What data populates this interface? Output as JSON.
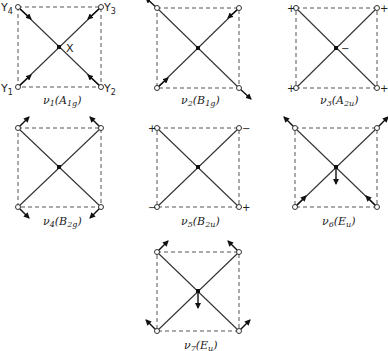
{
  "atom_labels": {
    "center": "X",
    "y1": "Y1",
    "y2": "Y2",
    "y3": "Y3",
    "y4": "Y4"
  },
  "modes": [
    {
      "id": "v1",
      "nu": "ν",
      "index": "1",
      "symmetry": "A",
      "sym_sub": "1g",
      "label": "ν1(A1g)",
      "type": "in-plane stretch, all outward"
    },
    {
      "id": "v2",
      "nu": "ν",
      "index": "2",
      "symmetry": "B",
      "sym_sub": "1g",
      "label": "ν2(B1g)",
      "type": "in-plane stretch, alternating"
    },
    {
      "id": "v3",
      "nu": "ν",
      "index": "3",
      "symmetry": "A",
      "sym_sub": "2u",
      "label": "ν3(A2u)",
      "type": "out-of-plane",
      "signs": {
        "corners": "+",
        "center": "−"
      }
    },
    {
      "id": "v4",
      "nu": "ν",
      "index": "4",
      "symmetry": "B",
      "sym_sub": "2g",
      "label": "ν4(B2g)",
      "type": "in-plane bend"
    },
    {
      "id": "v5",
      "nu": "ν",
      "index": "5",
      "symmetry": "B",
      "sym_sub": "2u",
      "label": "ν5(B2u)",
      "type": "out-of-plane",
      "signs": {
        "top_left": "+",
        "top_right": "−",
        "bottom_left": "−",
        "bottom_right": "+"
      }
    },
    {
      "id": "v6",
      "nu": "ν",
      "index": "6",
      "symmetry": "E",
      "sym_sub": "u",
      "label": "ν6(Eu)",
      "type": "asymmetric stretch"
    },
    {
      "id": "v7",
      "nu": "ν",
      "index": "7",
      "symmetry": "E",
      "sym_sub": "u",
      "label": "ν7(Eu)",
      "type": "asymmetric bend"
    }
  ],
  "colors": {
    "line": "#333333",
    "dash": "#555555",
    "background": "#ffffff"
  }
}
